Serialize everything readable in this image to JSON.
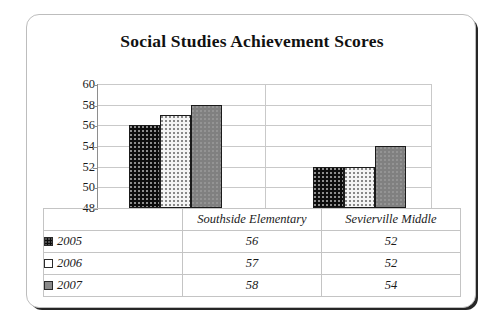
{
  "chart_data": {
    "type": "bar",
    "title": "Social Studies Achievement Scores",
    "xlabel": "",
    "ylabel": "",
    "categories": [
      "Southside Elementary",
      "Sevierville Middle"
    ],
    "series": [
      {
        "name": "2005",
        "values": [
          56,
          52
        ],
        "swatch": "black-dotted"
      },
      {
        "name": "2006",
        "values": [
          57,
          52
        ],
        "swatch": "white-dotted"
      },
      {
        "name": "2007",
        "values": [
          58,
          54
        ],
        "swatch": "gray-solid"
      }
    ],
    "ylim": [
      48,
      60
    ],
    "yticks": [
      48,
      50,
      52,
      54,
      56,
      58,
      60
    ],
    "ytick_labels": [
      "48",
      "50",
      "52",
      "54",
      "56",
      "58",
      "60"
    ],
    "grid": true,
    "legend_position": "bottom-table"
  },
  "table": {
    "header_row": [
      "",
      "Southside Elementary",
      "Sevierville Middle"
    ],
    "rows": [
      {
        "legend": "2005",
        "cells": [
          "56",
          "52"
        ]
      },
      {
        "legend": "2006",
        "cells": [
          "57",
          "52"
        ]
      },
      {
        "legend": "2007",
        "cells": [
          "58",
          "54"
        ]
      }
    ]
  },
  "colors": {
    "series_2005": "#0d0d0d",
    "series_2006": "#f4f4f4",
    "series_2007": "#808080",
    "gridline": "#c9c9c9",
    "axis": "#8e8e8e",
    "text": "#1a1a1a",
    "card_border": "#bdbdbd"
  }
}
